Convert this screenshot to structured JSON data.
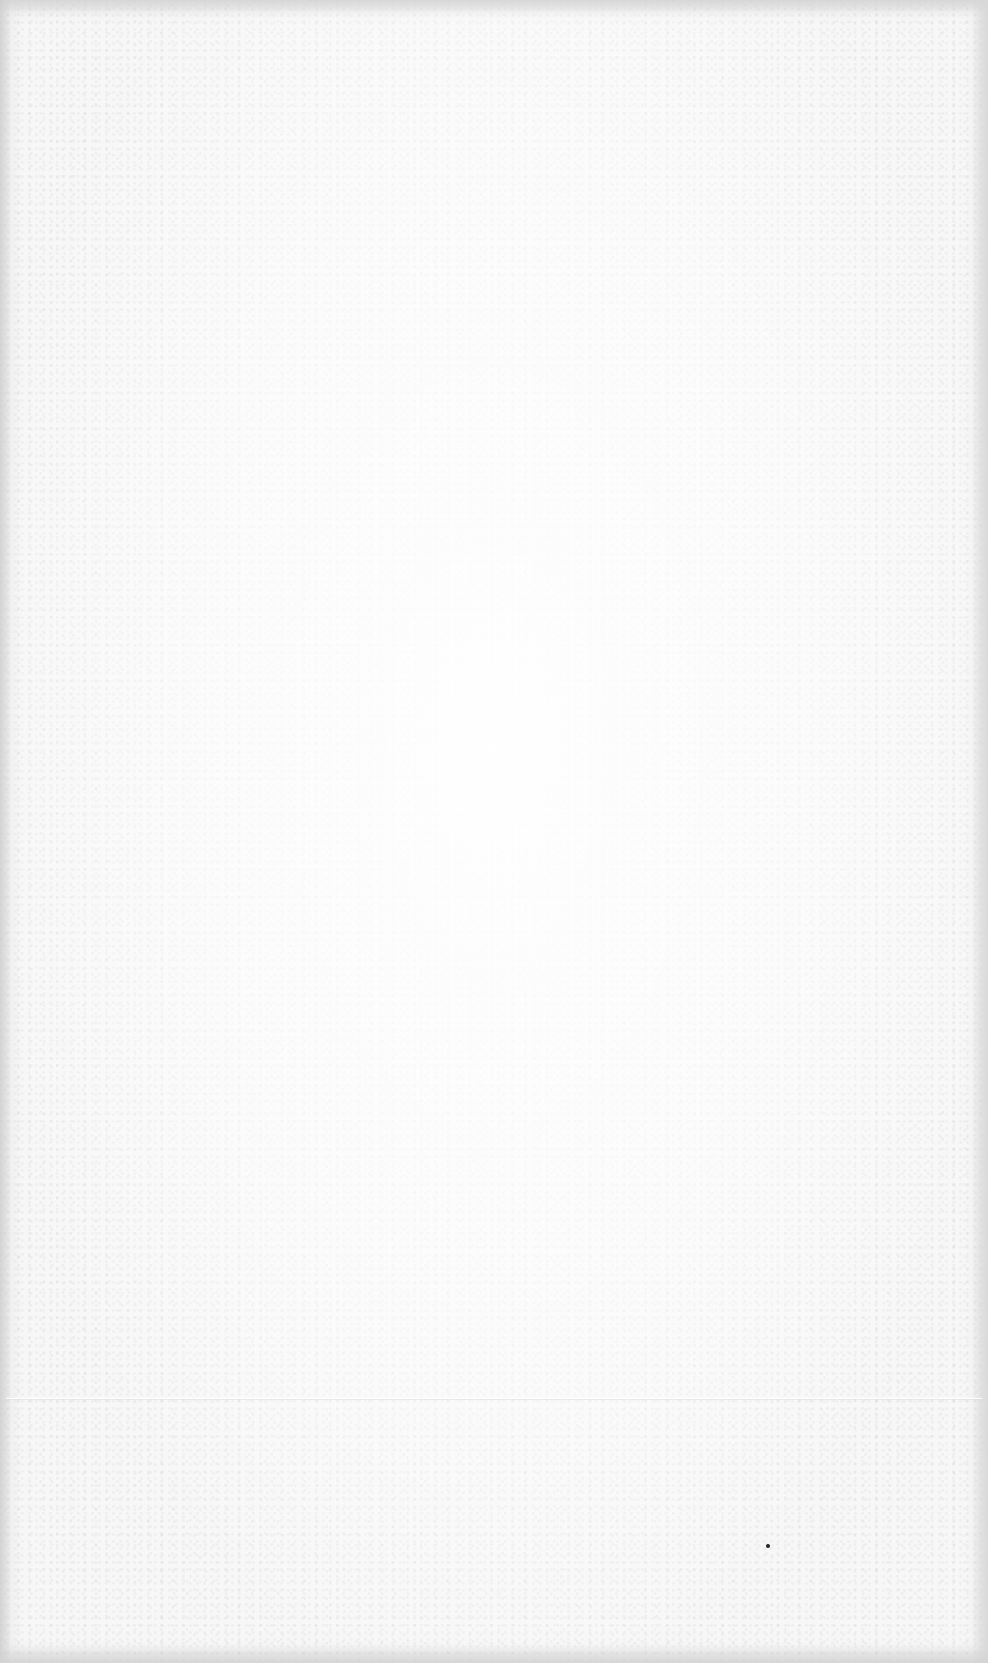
{
  "page": {
    "type": "blank-scanned-page",
    "text": "",
    "background_color": "#f7f7f7",
    "edge_shadow_color": "#d4d4d4",
    "speck_color": "#222222"
  }
}
